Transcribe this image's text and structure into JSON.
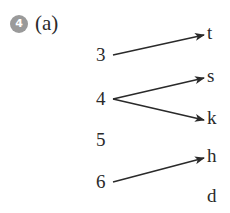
{
  "question": {
    "number": "4",
    "part": "(a)"
  },
  "mapping": {
    "domain": [
      "3",
      "4",
      "5",
      "6"
    ],
    "codomain": [
      "t",
      "s",
      "k",
      "h",
      "d"
    ],
    "arrows": [
      {
        "from": "3",
        "to": "t"
      },
      {
        "from": "4",
        "to": "s"
      },
      {
        "from": "4",
        "to": "k"
      },
      {
        "from": "6",
        "to": "h"
      }
    ]
  },
  "colors": {
    "badge": "#9a9a9a",
    "ink": "#2a2a2a"
  }
}
